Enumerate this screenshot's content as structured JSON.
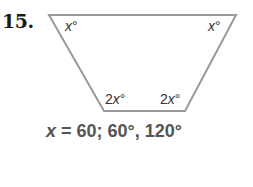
{
  "problem": {
    "number": "15.",
    "figure": {
      "shape": "trapezoid",
      "stroke_color": "#999999",
      "angles": {
        "top_left": {
          "var": "x",
          "coef": "",
          "deg": "°"
        },
        "top_right": {
          "var": "x",
          "coef": "",
          "deg": "°"
        },
        "bottom_left": {
          "var": "x",
          "coef": "2",
          "deg": "°"
        },
        "bottom_right": {
          "var": "x",
          "coef": "2",
          "deg": "°"
        }
      }
    },
    "answer": {
      "var": "x",
      "text": " = 60; 60°, 120°"
    }
  }
}
